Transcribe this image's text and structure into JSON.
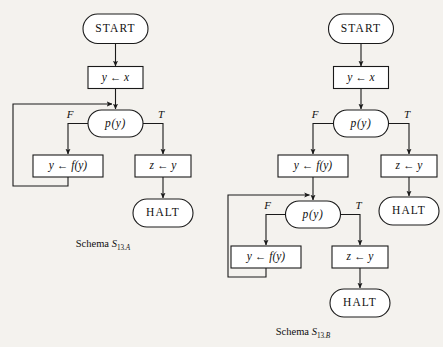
{
  "figure": {
    "background_color": "#f4f2ee",
    "ink_color": "#1a1a1a",
    "shape_fill": "#ffffff",
    "width": 443,
    "height": 347
  },
  "schema_a": {
    "caption_word": "Schema",
    "caption_symbol": "S",
    "caption_sub_number": "13.",
    "caption_sub_letter": "A",
    "nodes": {
      "start": "START",
      "init": "y ← x",
      "test": "p(y)",
      "false_action": "y ← f(y)",
      "true_action": "z ← y",
      "halt": "HALT"
    },
    "branches": {
      "false_label": "F",
      "true_label": "T"
    }
  },
  "schema_b": {
    "caption_word": "Schema",
    "caption_symbol": "S",
    "caption_sub_number": "13.",
    "caption_sub_letter": "B",
    "nodes": {
      "start": "START",
      "init": "y ← x",
      "test_1": "p(y)",
      "false_action_1": "y ← f(y)",
      "true_action_1": "z ← y",
      "halt_1": "HALT",
      "test_2": "p(y)",
      "false_action_2": "y ← f(y)",
      "true_action_2": "z ← y",
      "halt_2": "HALT"
    },
    "branches": {
      "false_label_1": "F",
      "true_label_1": "T",
      "false_label_2": "F",
      "true_label_2": "T"
    }
  }
}
